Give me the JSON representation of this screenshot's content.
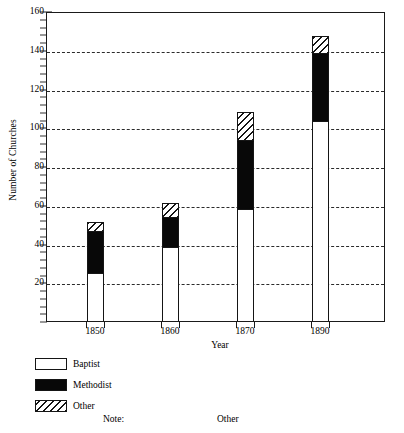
{
  "chart_data": {
    "type": "bar",
    "stacked": true,
    "title": "",
    "xlabel": "Year",
    "ylabel": "Number of Churches",
    "categories": [
      "1850",
      "1860",
      "1870",
      "1890"
    ],
    "series": [
      {
        "name": "Baptist",
        "values": [
          25,
          38,
          58,
          103
        ]
      },
      {
        "name": "Methodist",
        "values": [
          21,
          15,
          35,
          35
        ]
      },
      {
        "name": "Other",
        "values": [
          5,
          8,
          15,
          9
        ]
      }
    ],
    "totals": [
      51,
      61,
      108,
      147
    ],
    "ylim": [
      0,
      160
    ],
    "y_major_ticks": [
      20,
      40,
      60,
      80,
      100,
      120,
      140,
      160
    ],
    "y_minor_tick_interval": 4,
    "grid": "horizontal-dashed",
    "legend_position": "below-plot-left",
    "legend_entries": [
      "Baptist",
      "Methodist",
      "Other"
    ],
    "colors": {
      "Baptist": "#ffffff",
      "Methodist": "#080808",
      "Other": "#ffffff-hatched",
      "axis": "#1a1a1a",
      "gridline": "#2b2b2b"
    }
  },
  "axes": {
    "y_title": "Number of Churches",
    "x_title": "Year",
    "y_labels": [
      "160",
      "140",
      "120",
      "100",
      "80",
      "60",
      "40",
      "20"
    ],
    "x_labels": [
      "1850",
      "1860",
      "1870",
      "1890"
    ]
  },
  "legend": {
    "items": [
      {
        "label": "Baptist",
        "swatch": "white-fill-swatch"
      },
      {
        "label": "Methodist",
        "swatch": "black-fill-swatch"
      },
      {
        "label": "Other",
        "swatch": "hatched-fill-swatch"
      }
    ]
  },
  "footer": {
    "note_label": "Note:",
    "other_label": "Other"
  }
}
